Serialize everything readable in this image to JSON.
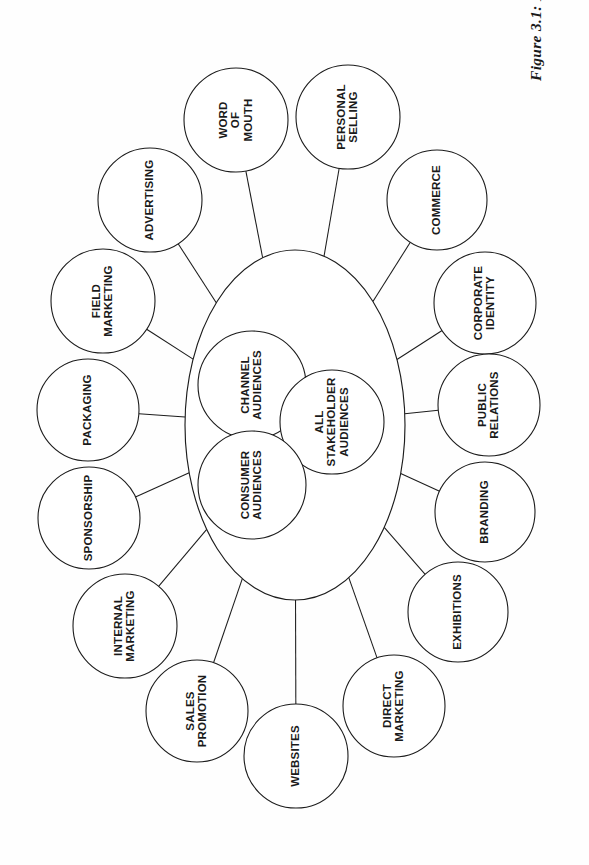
{
  "figure": {
    "caption": "Figure 3.1: Promotional tools",
    "background_color": "#fefefe",
    "line_color": "#1c1c1c",
    "text_color": "#1a1a1a"
  },
  "chart_data": {
    "type": "diagram",
    "title": "Figure 3.1: Promotional tools",
    "layout": "hub-and-spoke radial; a central ellipse containing three overlapping audience circles, surrounded by a ring of sixteen promotional-tool circles each joined to the ellipse by a straight connector line",
    "orientation": "all labels rotated 90 degrees (page printed in landscape)",
    "core": {
      "shape": "ellipse",
      "cx": 295,
      "cy": 425,
      "rx": 110,
      "ry": 175,
      "inner_circles": [
        {
          "id": "channel-audiences",
          "label": "CHANNEL AUDIENCES",
          "cx": 252,
          "cy": 385,
          "r": 54
        },
        {
          "id": "all-stakeholder",
          "label": "ALL STAKEHOLDER AUDIENCES",
          "cx": 332,
          "cy": 422,
          "r": 52
        },
        {
          "id": "consumer-audiences",
          "label": "CONSUMER AUDIENCES",
          "cx": 252,
          "cy": 485,
          "r": 54
        }
      ]
    },
    "ring_count": 16,
    "ring": [
      {
        "id": "word-of-mouth",
        "label": "WORD OF MOUTH",
        "cx": 236,
        "cy": 120,
        "r": 52,
        "angle_deg": 253
      },
      {
        "id": "personal-selling",
        "label": "PERSONAL SELLING",
        "cx": 348,
        "cy": 117,
        "r": 52,
        "angle_deg": 287
      },
      {
        "id": "commerce",
        "label": "COMMERCE",
        "cx": 437,
        "cy": 200,
        "r": 50,
        "angle_deg": 315
      },
      {
        "id": "corporate-identity",
        "label": "CORPORATE IDENTITY",
        "cx": 485,
        "cy": 303,
        "r": 51,
        "angle_deg": 339
      },
      {
        "id": "public-relations",
        "label": "PUBLIC RELATIONS",
        "cx": 489,
        "cy": 405,
        "r": 51,
        "angle_deg": 357
      },
      {
        "id": "branding",
        "label": "BRANDING",
        "cx": 485,
        "cy": 512,
        "r": 50,
        "angle_deg": 20
      },
      {
        "id": "exhibitions",
        "label": "EXHIBITIONS",
        "cx": 458,
        "cy": 612,
        "r": 50,
        "angle_deg": 42
      },
      {
        "id": "direct-marketing",
        "label": "DIRECT MARKETING",
        "cx": 394,
        "cy": 706,
        "r": 51,
        "angle_deg": 62
      },
      {
        "id": "websites",
        "label": "WEBSITES",
        "cx": 296,
        "cy": 756,
        "r": 52,
        "angle_deg": 88
      },
      {
        "id": "sales-promotion",
        "label": "SALES PROMOTION",
        "cx": 197,
        "cy": 711,
        "r": 51,
        "angle_deg": 110
      },
      {
        "id": "internal-marketing",
        "label": "INTERNAL MARKETING",
        "cx": 125,
        "cy": 626,
        "r": 52,
        "angle_deg": 133
      },
      {
        "id": "sponsorship",
        "label": "SPONSORSHIP",
        "cx": 89,
        "cy": 518,
        "r": 51,
        "angle_deg": 156
      },
      {
        "id": "packaging",
        "label": "PACKAGING",
        "cx": 88,
        "cy": 410,
        "r": 51,
        "angle_deg": 178
      },
      {
        "id": "field-marketing",
        "label": "FIELD MARKETING",
        "cx": 103,
        "cy": 301,
        "r": 52,
        "angle_deg": 200
      },
      {
        "id": "advertising",
        "label": "ADVERTISING",
        "cx": 150,
        "cy": 200,
        "r": 52,
        "angle_deg": 222
      }
    ]
  }
}
